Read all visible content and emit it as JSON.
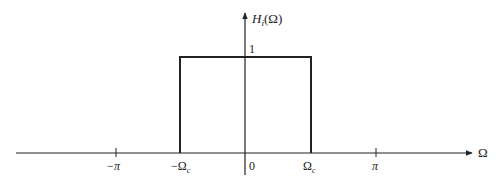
{
  "diagram": {
    "type": "ideal-lowpass-frequency-response",
    "y_axis_label": "H",
    "y_axis_label_sub": "i",
    "y_axis_label_arg": "(Ω)",
    "x_axis_label": "Ω",
    "amplitude_label": "1",
    "ticks": [
      {
        "label": "−π",
        "position": "-pi"
      },
      {
        "label": "−Ω",
        "sub": "c",
        "position": "-omega_c"
      },
      {
        "label": "0",
        "position": "0"
      },
      {
        "label": "Ω",
        "sub": "c",
        "position": "omega_c"
      },
      {
        "label": "π",
        "position": "pi"
      }
    ],
    "passband": {
      "from": "-Ω_c",
      "to": "Ω_c",
      "gain": 1
    },
    "line_color": "#222222"
  }
}
